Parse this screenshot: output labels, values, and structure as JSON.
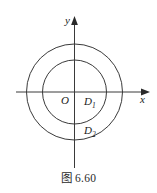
{
  "figure": {
    "caption": "图 6.60",
    "background_color": "#ffffff",
    "stroke_color": "#3a3a3a",
    "axes": {
      "x_label": "x",
      "y_label": "y",
      "origin_label": "O",
      "x_axis_name": "x-axis",
      "y_axis_name": "y-axis"
    },
    "regions": [
      {
        "label_base": "D",
        "label_sub": "1",
        "name": "inner-disk-region"
      },
      {
        "label_base": "D",
        "label_sub": "2",
        "name": "annulus-region"
      }
    ],
    "circles": [
      {
        "name": "inner-circle",
        "cx": 74.5,
        "cy": 92,
        "r": 32
      },
      {
        "name": "outer-circle",
        "cx": 74.5,
        "cy": 92,
        "r": 48
      }
    ]
  }
}
